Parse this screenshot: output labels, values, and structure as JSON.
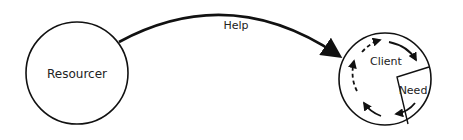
{
  "diagram": {
    "nodes": {
      "resourcer": {
        "label": "Resourcer"
      },
      "client": {
        "label": "Client"
      },
      "need": {
        "label": "Need"
      }
    },
    "edges": {
      "help": {
        "label": "Help",
        "from": "Resourcer",
        "to": "Client"
      }
    },
    "colors": {
      "stroke": "#111111",
      "text": "#222222",
      "background": "#ffffff"
    }
  }
}
